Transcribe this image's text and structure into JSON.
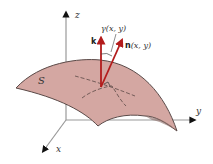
{
  "diagram": {
    "surface_label": "S",
    "axes": {
      "x": "x",
      "y": "y",
      "z": "z"
    },
    "vectors": {
      "k": {
        "label": "k"
      },
      "n": {
        "label_bold": "n",
        "label_rest": "(x, y)"
      }
    },
    "angle_label": "γ(x, y)",
    "colors": {
      "surface_fill": "#d4a7a2",
      "surface_stroke": "#5a4a48",
      "vector": "#b31c1c",
      "axis": "#999999",
      "axis_head": "#111111"
    }
  }
}
